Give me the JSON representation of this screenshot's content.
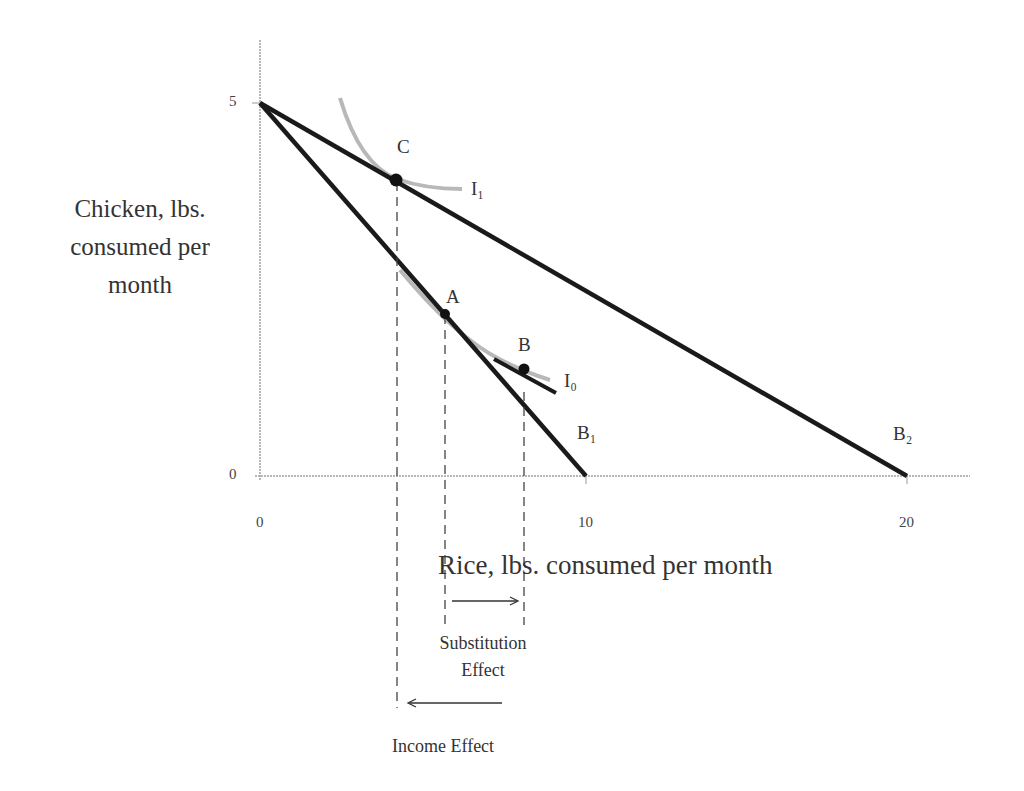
{
  "diagram": {
    "y_axis_label": "Chicken, lbs. consumed per month",
    "y_axis_label_lines": [
      "Chicken, lbs.",
      "consumed per",
      "month"
    ],
    "x_axis_label": "Rice, lbs. consumed per month",
    "y_ticks": [
      "5",
      "0"
    ],
    "x_ticks": [
      "0",
      "10",
      "20"
    ],
    "points": {
      "A": "A",
      "B": "B",
      "C": "C"
    },
    "curves": {
      "I0": "I₀",
      "I1": "I₁",
      "B1": "B₁",
      "B2": "B₂"
    },
    "curve_labels_plain": {
      "I0": "Io",
      "I1": "I1",
      "B1": "B1",
      "B2": "B2"
    },
    "substitution_effect": [
      "Substitution",
      "Effect"
    ],
    "income_effect": "Income Effect",
    "colors": {
      "budget_line": "#1a1a1a",
      "indifference_curve": "#b8b8b8",
      "axis": "#999999",
      "dashed": "#444444"
    }
  }
}
